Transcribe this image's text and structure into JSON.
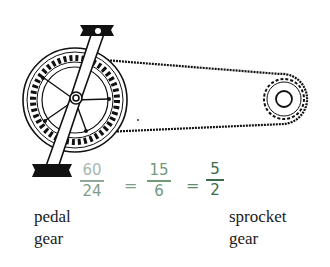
{
  "labels": {
    "pedal_gear_line1": "pedal",
    "pedal_gear_line2": "gear",
    "sprocket_gear_line1": "sprocket",
    "sprocket_gear_line2": "gear"
  },
  "equation": {
    "fraction1": {
      "numerator": "60",
      "denominator": "24"
    },
    "equals1": "=",
    "fraction2": {
      "numerator": "15",
      "denominator": "6"
    },
    "equals2": "=",
    "fraction3": {
      "numerator": "5",
      "denominator": "2"
    }
  },
  "colors": {
    "ink": "#111111",
    "handwriting_light": "#9fb3a6",
    "handwriting_mid": "#6f9a7c",
    "handwriting_dark": "#3d6b4a"
  },
  "drawing": {
    "pedal_gear_center": [
      75,
      100
    ],
    "sprocket_center": [
      284,
      99
    ]
  }
}
